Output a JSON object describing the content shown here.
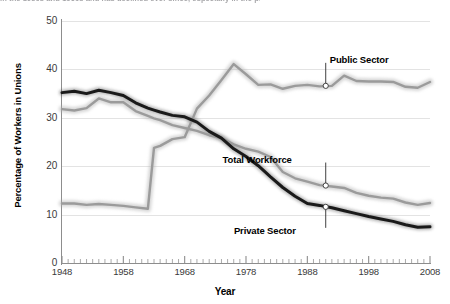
{
  "caption_sliver": "in the 1950s and 1960s and has declined ever since, especially in the private sector.",
  "chart_data": {
    "type": "line",
    "title": "",
    "xlabel": "Year",
    "ylabel": "Percentage of Workers in Unions",
    "xlim": [
      1948,
      2008
    ],
    "ylim": [
      0,
      50
    ],
    "grid": true,
    "legend_position": "inline-annotations",
    "x_ticks_major": [
      1948,
      1958,
      1968,
      1978,
      1988,
      1998,
      2008
    ],
    "x_ticks_minor_step": 1,
    "y_ticks": [
      0,
      10,
      20,
      30,
      40,
      50
    ],
    "x": [
      1948,
      1950,
      1952,
      1954,
      1956,
      1958,
      1960,
      1962,
      1963,
      1964,
      1966,
      1968,
      1970,
      1972,
      1974,
      1976,
      1978,
      1980,
      1982,
      1984,
      1986,
      1988,
      1990,
      1992,
      1994,
      1996,
      1998,
      2000,
      2002,
      2004,
      2006,
      2008
    ],
    "series": [
      {
        "name": "Public Sector",
        "color": "#9b9b9b",
        "style": "thick-gray",
        "values": [
          12.3,
          12.3,
          12.0,
          12.2,
          12.0,
          11.8,
          11.5,
          11.2,
          23.8,
          24.2,
          25.6,
          26.0,
          31.9,
          34.6,
          37.8,
          41.1,
          39.0,
          36.8,
          36.9,
          36.0,
          36.6,
          36.8,
          36.5,
          36.6,
          38.7,
          37.6,
          37.5,
          37.5,
          37.4,
          36.4,
          36.2,
          37.4
        ],
        "label_point": {
          "x": 1991,
          "y": 36.6
        },
        "label_offset": {
          "dx": 4,
          "dy": -26
        }
      },
      {
        "name": "Total Workforce",
        "color": "#9b9b9b",
        "style": "thick-gray",
        "values": [
          31.8,
          31.5,
          32.0,
          34.0,
          33.2,
          33.2,
          31.4,
          30.4,
          29.9,
          29.5,
          28.5,
          27.9,
          27.3,
          26.4,
          25.8,
          24.5,
          23.6,
          23.0,
          21.9,
          18.8,
          17.5,
          16.8,
          16.1,
          15.8,
          15.5,
          14.5,
          13.9,
          13.5,
          13.3,
          12.5,
          12.0,
          12.4
        ],
        "label_point": {
          "x": 1991,
          "y": 16.0
        },
        "label_offset": {
          "dx": -34,
          "dy": -26
        }
      },
      {
        "name": "Private Sector",
        "color": "#1a1a1a",
        "style": "thick-black",
        "values": [
          35.2,
          35.5,
          35.0,
          35.7,
          35.2,
          34.6,
          33.1,
          32.0,
          31.6,
          31.2,
          30.5,
          30.2,
          29.1,
          27.2,
          25.8,
          23.6,
          22.0,
          20.1,
          17.8,
          15.6,
          13.8,
          12.3,
          11.9,
          11.4,
          10.8,
          10.2,
          9.6,
          9.1,
          8.6,
          7.9,
          7.4,
          7.5
        ],
        "label_point": {
          "x": 1991,
          "y": 11.6
        },
        "label_offset": {
          "dx": -30,
          "dy": 24
        }
      }
    ]
  },
  "annotations": [
    {
      "id": "public-sector",
      "text": "Public Sector"
    },
    {
      "id": "total-workforce",
      "text": "Total Workforce"
    },
    {
      "id": "private-sector",
      "text": "Private Sector"
    }
  ],
  "axis": {
    "y_tick_labels": [
      "0",
      "10",
      "20",
      "30",
      "40",
      "50"
    ],
    "x_tick_labels": [
      "1948",
      "1958",
      "1968",
      "1978",
      "1988",
      "1998",
      "2008"
    ],
    "x_title": "Year",
    "y_title": "Percentage of Workers in Unions"
  },
  "colors": {
    "private_sector": "#1a1a1a",
    "public_sector": "#9b9b9b",
    "total_workforce": "#9b9b9b",
    "gridline": "#e3e3e3",
    "axis": "#8d8d8d",
    "marker_fill": "#ffffff",
    "marker_stroke": "#333333"
  }
}
